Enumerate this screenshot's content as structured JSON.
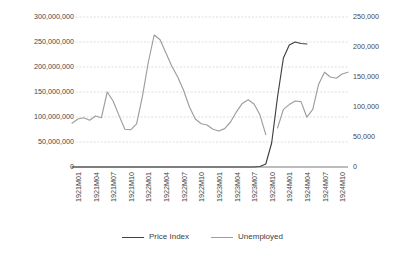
{
  "chart_data": {
    "type": "line",
    "title": "",
    "subtitle": "",
    "xlabel": "",
    "ylabel": "",
    "y2label": "",
    "grid": true,
    "legend_position": "bottom",
    "x": [
      "1921M01",
      "1921M02",
      "1921M03",
      "1921M04",
      "1921M05",
      "1921M06",
      "1921M07",
      "1921M08",
      "1921M09",
      "1921M10",
      "1921M11",
      "1921M12",
      "1922M01",
      "1922M02",
      "1922M03",
      "1922M04",
      "1922M05",
      "1922M06",
      "1922M07",
      "1922M08",
      "1922M09",
      "1922M10",
      "1922M11",
      "1922M12",
      "1923M01",
      "1923M02",
      "1923M03",
      "1923M04",
      "1923M05",
      "1923M06",
      "1923M07",
      "1923M08",
      "1923M09",
      "1923M10",
      "1923M11",
      "1923M12",
      "1924M01",
      "1924M02",
      "1924M03",
      "1924M04",
      "1924M05",
      "1924M06",
      "1924M07",
      "1924M08",
      "1924M09",
      "1924M10",
      "1924M11",
      "1924M12"
    ],
    "xticklabels": [
      "1921M01",
      "1921M04",
      "1921M07",
      "1921M10",
      "1922M01",
      "1922M04",
      "1922M07",
      "1922M10",
      "1923M01",
      "1923M04",
      "1923M07",
      "1923M10",
      "1924M01",
      "1924M04",
      "1924M07",
      "1924M10"
    ],
    "yticklabels": [
      "300,000,000",
      "250,000,000",
      "200,000,000",
      "150,000,000",
      "100,000,000",
      "50,000,000",
      "0"
    ],
    "y2ticklabels": [
      "250,000",
      "200,000",
      "150,000",
      "100,000",
      "50,000",
      "0"
    ],
    "ylim": [
      0,
      300000000
    ],
    "y2lim": [
      0,
      250000
    ],
    "series": [
      {
        "name": "Price Index",
        "axis": "left",
        "color": "#404040",
        "values": [
          1,
          1,
          1,
          1,
          1,
          1,
          1,
          1,
          1,
          1,
          1,
          2,
          2,
          2,
          2,
          2,
          3,
          3,
          4,
          5,
          6,
          8,
          11,
          15,
          25,
          60,
          130,
          280,
          600,
          1600,
          4500,
          18000,
          900000,
          6000000,
          48000000,
          140000000,
          218000000,
          244000000,
          250000000,
          247000000,
          246000000,
          null,
          null,
          null,
          null,
          null,
          null,
          null
        ]
      },
      {
        "name": "Unemployed",
        "axis": "right",
        "color": "#9d9d9d",
        "values": [
          73000,
          80000,
          82000,
          78000,
          85000,
          82000,
          125000,
          110000,
          86000,
          63000,
          62000,
          72000,
          118000,
          175000,
          220000,
          212000,
          190000,
          168000,
          150000,
          128000,
          100000,
          80000,
          72000,
          70000,
          63000,
          60000,
          64000,
          75000,
          92000,
          106000,
          112000,
          105000,
          87000,
          54000,
          null,
          65000,
          96000,
          104000,
          110000,
          109000,
          83000,
          96000,
          138000,
          158000,
          150000,
          148000,
          155000,
          158000
        ]
      }
    ]
  },
  "legend": {
    "items": [
      {
        "label": "Price Index",
        "color": "#404040"
      },
      {
        "label": "Unemployed",
        "color": "#9d9d9d"
      }
    ]
  },
  "axes": {
    "gridline_color": "#d0d0d0",
    "axis_line_color": "#808080",
    "tick_text_color": "#464646"
  }
}
